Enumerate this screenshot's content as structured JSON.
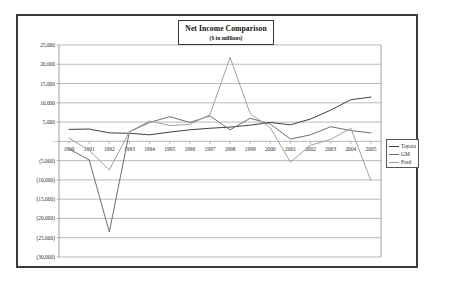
{
  "chart_data": {
    "type": "line",
    "title": "Net Income Comparison",
    "subtitle": "($ in millions)",
    "xlabel": "",
    "ylabel": "",
    "grid": true,
    "legend_position": "right",
    "ylim": [
      -30000,
      25000
    ],
    "ytick_labels": [
      "25,000",
      "20,000",
      "15,000",
      "10,000",
      "5,000",
      "-",
      "(5,000)",
      "(10,000)",
      "(15,000)",
      "(20,000)",
      "(25,000)",
      "(30,000)"
    ],
    "ytick_values": [
      25000,
      20000,
      15000,
      10000,
      5000,
      0,
      -5000,
      -10000,
      -15000,
      -20000,
      -25000,
      -30000
    ],
    "categories": [
      "1990",
      "1991",
      "1992",
      "1993",
      "1994",
      "1995",
      "1996",
      "1997",
      "1998",
      "1999",
      "2000",
      "2001",
      "2002",
      "2003",
      "2004",
      "2005"
    ],
    "series": [
      {
        "name": "Toyota",
        "color": "#404040",
        "values": [
          3100,
          3200,
          2200,
          2100,
          1700,
          2400,
          3000,
          3400,
          3700,
          4200,
          4900,
          4300,
          5800,
          8100,
          10800,
          11500
        ]
      },
      {
        "name": "GM",
        "color": "#6e6e6e",
        "values": [
          -2000,
          -4800,
          -23500,
          2500,
          4900,
          6400,
          4900,
          6600,
          3000,
          6000,
          4500,
          600,
          1700,
          3800,
          2800,
          2200
        ]
      },
      {
        "name": "Ford",
        "color": "#a0a0a0",
        "values": [
          860,
          -2300,
          -7400,
          2500,
          5300,
          4100,
          4400,
          6900,
          21800,
          7200,
          3500,
          -5400,
          -1000,
          500,
          3400,
          -10200
        ]
      }
    ]
  },
  "legend": {
    "items": [
      {
        "label": "Toyota"
      },
      {
        "label": "GM"
      },
      {
        "label": "Ford"
      }
    ]
  }
}
